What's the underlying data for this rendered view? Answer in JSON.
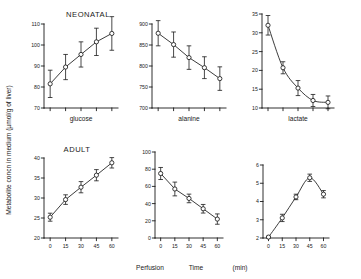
{
  "figure": {
    "y_axis_title": "Metabolite  concn  in  medium  (µmol/g of liver)",
    "x_axis_title_parts": [
      "Perfusion",
      "Time",
      "(min)"
    ],
    "x_axis_title": "Perfusion    Time    (min)",
    "row_titles": {
      "top": "NEONATAL",
      "bottom": "ADULT"
    },
    "panel_captions": {
      "glucose": "glucose",
      "alanine": "alanine",
      "lactate": "lactate"
    },
    "x_ticks": [
      0,
      15,
      30,
      45,
      60
    ],
    "line_color": "#1a1a1a",
    "marker_fill": "#ffffff",
    "background": "#ffffff"
  },
  "chart_data": [
    {
      "type": "line",
      "id": "neonatal-glucose",
      "title": "NEONATAL",
      "caption": "glucose",
      "xlabel": "Perfusion Time (min)",
      "ylabel": "Metabolite concn in medium (µmol/g of liver)",
      "x": [
        0,
        15,
        30,
        45,
        60
      ],
      "values": [
        81.5,
        89.5,
        95.5,
        101.5,
        105.5
      ],
      "errors": [
        6.5,
        6.0,
        6.0,
        6.5,
        8.0
      ],
      "xlim": [
        -6,
        66
      ],
      "ylim": [
        70,
        110
      ],
      "yticks": [
        70,
        80,
        90,
        100,
        110
      ],
      "grid": false
    },
    {
      "type": "line",
      "id": "neonatal-alanine",
      "title": "NEONATAL",
      "caption": "alanine",
      "xlabel": "Perfusion Time (min)",
      "ylabel": "Metabolite concn in medium (µmol/g of liver)",
      "x": [
        0,
        15,
        30,
        45,
        60
      ],
      "values": [
        878,
        851,
        820,
        796,
        770
      ],
      "errors": [
        30,
        30,
        28,
        26,
        28
      ],
      "xlim": [
        -6,
        66
      ],
      "ylim": [
        700,
        900
      ],
      "yticks": [
        700,
        750,
        800,
        850,
        900
      ],
      "grid": false
    },
    {
      "type": "line",
      "id": "neonatal-lactate",
      "title": "NEONATAL",
      "caption": "lactate",
      "xlabel": "Perfusion Time (min)",
      "ylabel": "Metabolite concn in medium (µmol/g of liver)",
      "x": [
        0,
        15,
        30,
        45,
        60
      ],
      "values": [
        32.0,
        20.7,
        15.3,
        12.0,
        11.5
      ],
      "errors": [
        2.6,
        1.6,
        2.0,
        1.6,
        1.7
      ],
      "xlim": [
        -6,
        66
      ],
      "ylim": [
        10,
        35
      ],
      "yticks": [
        10,
        15,
        20,
        25,
        30,
        35
      ],
      "grid": false
    },
    {
      "type": "line",
      "id": "adult-glucose",
      "title": "ADULT",
      "caption": "glucose",
      "xlabel": "Perfusion Time (min)",
      "ylabel": "Metabolite concn in medium (µmol/g of liver)",
      "x": [
        0,
        15,
        30,
        45,
        60
      ],
      "values": [
        25.2,
        29.6,
        32.7,
        35.7,
        38.8
      ],
      "errors": [
        1.0,
        1.2,
        1.4,
        1.4,
        1.3
      ],
      "xlim": [
        -6,
        66
      ],
      "ylim": [
        20,
        40
      ],
      "yticks": [
        20,
        25,
        30,
        35,
        40
      ],
      "grid": false
    },
    {
      "type": "line",
      "id": "adult-alanine",
      "title": "ADULT",
      "caption": "alanine",
      "xlabel": "Perfusion Time (min)",
      "ylabel": "Metabolite concn in medium (µmol/g of liver)",
      "x": [
        0,
        15,
        30,
        45,
        60
      ],
      "values": [
        75,
        57,
        46,
        34,
        22
      ],
      "errors": [
        7,
        8,
        5,
        5,
        6
      ],
      "xlim": [
        -6,
        66
      ],
      "ylim": [
        0,
        100
      ],
      "yticks": [
        0,
        20,
        40,
        60,
        80,
        100
      ],
      "grid": false
    },
    {
      "type": "line",
      "id": "adult-lactate",
      "title": "ADULT",
      "caption": "lactate",
      "xlabel": "Perfusion Time (min)",
      "ylabel": "Metabolite concn in medium (µmol/g of liver)",
      "x": [
        0,
        15,
        30,
        45,
        60
      ],
      "values": [
        2.05,
        3.1,
        4.25,
        5.3,
        4.4
      ],
      "errors": [
        0.05,
        0.2,
        0.15,
        0.2,
        0.2
      ],
      "xlim": [
        -6,
        66
      ],
      "ylim": [
        2,
        6
      ],
      "yticks": [
        2,
        3,
        4,
        5,
        6
      ],
      "grid": false
    }
  ]
}
